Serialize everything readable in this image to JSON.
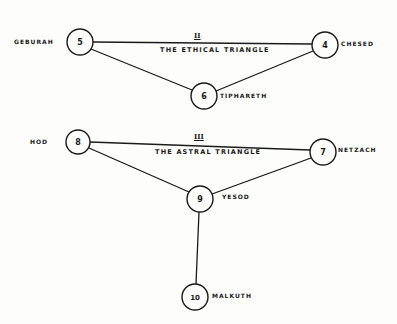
{
  "diagram": {
    "stroke_color": "#1a1a1a",
    "background": "#fdfdfc",
    "triangles": [
      {
        "numeral": "II",
        "title": "The Ethical Triangle",
        "nodes": [
          "geburah",
          "chesed",
          "tiphareth"
        ]
      },
      {
        "numeral": "III",
        "title": "The Astral Triangle",
        "nodes": [
          "hod",
          "netzach",
          "yesod"
        ]
      }
    ],
    "nodes": {
      "geburah": {
        "number": "5",
        "name": "Geburah",
        "x": 80,
        "y": 42
      },
      "chesed": {
        "number": "4",
        "name": "Chesed",
        "x": 325,
        "y": 45
      },
      "tiphareth": {
        "number": "6",
        "name": "Tiphareth",
        "x": 204,
        "y": 96
      },
      "hod": {
        "number": "8",
        "name": "Hod",
        "x": 78,
        "y": 142
      },
      "netzach": {
        "number": "7",
        "name": "Netzach",
        "x": 323,
        "y": 152
      },
      "yesod": {
        "number": "9",
        "name": "Yesod",
        "x": 200,
        "y": 199
      },
      "malkuth": {
        "number": "10",
        "name": "Malkuth",
        "x": 195,
        "y": 297
      }
    },
    "edges": [
      [
        "geburah",
        "chesed"
      ],
      [
        "geburah",
        "tiphareth"
      ],
      [
        "chesed",
        "tiphareth"
      ],
      [
        "hod",
        "netzach"
      ],
      [
        "hod",
        "yesod"
      ],
      [
        "netzach",
        "yesod"
      ],
      [
        "yesod",
        "malkuth"
      ]
    ]
  }
}
